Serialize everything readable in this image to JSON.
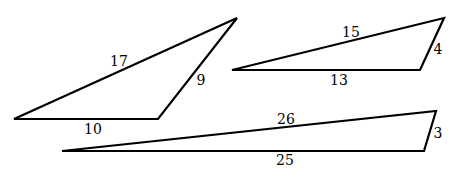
{
  "triangles": [
    {
      "id": "triangle-1",
      "vertices": [
        [
          14,
          119
        ],
        [
          158,
          119
        ],
        [
          237,
          18
        ]
      ],
      "sides": [
        {
          "label": "17",
          "x": 119,
          "y": 66
        },
        {
          "label": "9",
          "x": 201,
          "y": 85
        },
        {
          "label": "10",
          "x": 93,
          "y": 134
        }
      ]
    },
    {
      "id": "triangle-2",
      "vertices": [
        [
          232,
          70
        ],
        [
          420,
          70
        ],
        [
          444,
          18
        ]
      ],
      "sides": [
        {
          "label": "15",
          "x": 351,
          "y": 37
        },
        {
          "label": "4",
          "x": 438,
          "y": 54
        },
        {
          "label": "13",
          "x": 339,
          "y": 85
        }
      ]
    },
    {
      "id": "triangle-3",
      "vertices": [
        [
          62,
          151
        ],
        [
          424,
          151
        ],
        [
          436,
          111
        ]
      ],
      "sides": [
        {
          "label": "26",
          "x": 286,
          "y": 124
        },
        {
          "label": "3",
          "x": 438,
          "y": 138
        },
        {
          "label": "25",
          "x": 285,
          "y": 165
        }
      ]
    }
  ],
  "style": {
    "stroke": "#000000",
    "stroke_width": 2.2
  }
}
